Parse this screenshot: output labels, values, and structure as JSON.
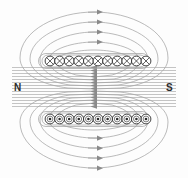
{
  "diagram": {
    "labels": {
      "north_pole": "N",
      "south_pole": "S"
    },
    "colors": {
      "field_line": "#9a9a9a",
      "coil_outline": "#2b2b2b",
      "arrow": "#7d7d7d",
      "label_text": "#2b2b2b",
      "background": "#fdfdfd"
    },
    "coils": {
      "top_row": {
        "symbol": "cross",
        "meaning": "current into page",
        "count": 11,
        "y": 61,
        "x_start": 45,
        "spacing": 10,
        "radius": 5
      },
      "bottom_row": {
        "symbol": "dot",
        "meaning": "current out of page",
        "count": 11,
        "y": 119,
        "x_start": 45,
        "spacing": 10,
        "radius": 5
      }
    },
    "field_lines": {
      "center_line_count": 13,
      "center_arrow_direction": "left",
      "outer_loop_count": 5,
      "outer_arrow_direction": "right"
    }
  }
}
